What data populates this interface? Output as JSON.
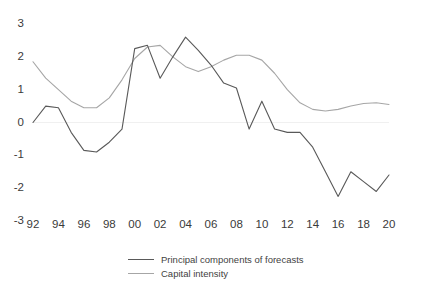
{
  "chart_data": {
    "type": "line",
    "title": "",
    "xlabel": "",
    "ylabel": "",
    "ylim": [
      -3,
      3
    ],
    "xlim": [
      1992,
      2020
    ],
    "grid": false,
    "legend_position": "bottom",
    "y_ticks": [
      "3",
      "2",
      "1",
      "0",
      "-1",
      "-2",
      "-3"
    ],
    "y_tick_values": [
      3,
      2,
      1,
      0,
      -1,
      -2,
      -3
    ],
    "x_ticks": [
      "92",
      "94",
      "96",
      "98",
      "00",
      "02",
      "04",
      "06",
      "08",
      "10",
      "12",
      "14",
      "16",
      "18",
      "20"
    ],
    "x_tick_values": [
      1992,
      1994,
      1996,
      1998,
      2000,
      2002,
      2004,
      2006,
      2008,
      2010,
      2012,
      2014,
      2016,
      2018,
      2020
    ],
    "x": [
      1992,
      1993,
      1994,
      1995,
      1996,
      1997,
      1998,
      1999,
      2000,
      2001,
      2002,
      2003,
      2004,
      2005,
      2006,
      2007,
      2008,
      2009,
      2010,
      2011,
      2012,
      2013,
      2014,
      2015,
      2016,
      2017,
      2018,
      2019,
      2020
    ],
    "series": [
      {
        "name": "Principal components of forecasts",
        "color": "#595959",
        "values": [
          0.0,
          0.5,
          0.45,
          -0.3,
          -0.85,
          -0.9,
          -0.6,
          -0.2,
          2.25,
          2.35,
          1.35,
          2.0,
          2.6,
          2.2,
          1.75,
          1.2,
          1.05,
          -0.2,
          0.65,
          -0.2,
          -0.3,
          -0.3,
          -0.75,
          -1.5,
          -2.25,
          -1.5,
          -1.8,
          -2.1,
          -1.6
        ]
      },
      {
        "name": "Capital intensity",
        "color": "#a6a6a6",
        "values": [
          1.85,
          1.35,
          1.0,
          0.65,
          0.45,
          0.45,
          0.75,
          1.3,
          1.95,
          2.3,
          2.35,
          2.0,
          1.7,
          1.55,
          1.7,
          1.9,
          2.05,
          2.05,
          1.9,
          1.5,
          1.0,
          0.6,
          0.4,
          0.35,
          0.4,
          0.5,
          0.58,
          0.6,
          0.55
        ]
      }
    ]
  },
  "legend": {
    "items": [
      {
        "label": "Principal components of forecasts",
        "color": "#595959"
      },
      {
        "label": "Capital intensity",
        "color": "#a6a6a6"
      }
    ]
  }
}
